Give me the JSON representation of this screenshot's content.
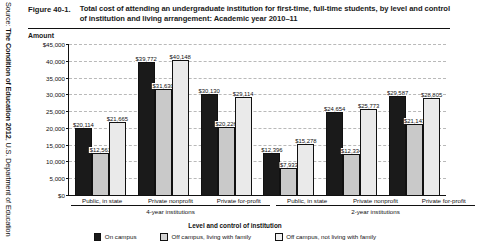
{
  "source_note": {
    "prefix": "Source: ",
    "bold": "The Condition of Education 2012",
    "suffix": ", U.S. Department of Education"
  },
  "figure": {
    "number": "Figure 40-1.",
    "title": "Total cost of attending an undergraduate institution for first-time, full-time students, by level and control of institution and living arrangement: Academic year 2010–11",
    "amount_label": "Amount"
  },
  "chart_data": {
    "type": "bar",
    "title": "Total cost of attending an undergraduate institution for first-time, full-time students, by level and control of institution and living arrangement: Academic year 2010–11",
    "xlabel": "Level and control of institution",
    "ylabel": "Amount",
    "ylim": [
      0,
      45000
    ],
    "ytick_labels": [
      "$45,000",
      "40,000",
      "35,000",
      "30,000",
      "25,000",
      "20,000",
      "15,000",
      "10,000",
      "5,000",
      "$0"
    ],
    "ytick_values": [
      45000,
      40000,
      35000,
      30000,
      25000,
      20000,
      15000,
      10000,
      5000,
      0
    ],
    "grid": true,
    "legend_position": "bottom",
    "categories": [
      "Public, in state",
      "Private nonprofit",
      "Private for-profit",
      "Public, in state",
      "Private nonprofit",
      "Private for-profit"
    ],
    "supercategories": [
      {
        "label": "4-year institutions",
        "span": 3
      },
      {
        "label": "2-year institutions",
        "span": 3
      }
    ],
    "series": [
      {
        "name": "On campus",
        "color": "#1a1a1a",
        "values": [
          20114,
          39772,
          30130,
          12396,
          24654,
          29587
        ],
        "labels": [
          "$20,114",
          "$39,772",
          "$30,130",
          "$12,396",
          "$24,654",
          "$29,587"
        ]
      },
      {
        "name": "Off campus, living with family",
        "color": "#c9c9c9",
        "values": [
          12561,
          31630,
          20226,
          7933,
          12334,
          21143
        ],
        "labels": [
          "$12,561",
          "$31,630",
          "$20,226",
          "$7,933",
          "$12,334",
          "$21,143"
        ]
      },
      {
        "name": "Off campus, not living with family",
        "color": "#eaeaea",
        "values": [
          21665,
          40148,
          29114,
          15278,
          25773,
          28805
        ],
        "labels": [
          "$21,665",
          "$40,148",
          "$29,114",
          "$15,278",
          "$25,773",
          "$28,805"
        ]
      }
    ]
  }
}
